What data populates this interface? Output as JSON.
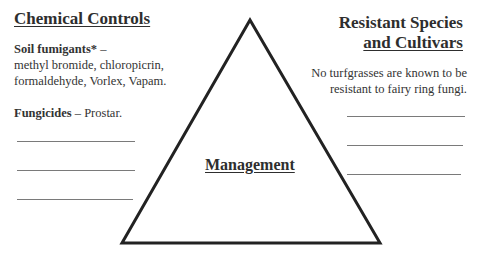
{
  "diagram": {
    "center_label": "Management",
    "left": {
      "title": "Chemical Controls",
      "items": [
        {
          "label": "Soil fumigants*",
          "separator": " –",
          "text": "methyl bromide, chloropicrin, formaldehyde, Vorlex, Vapam."
        },
        {
          "label": "Fungicides",
          "separator": " – ",
          "text": "Prostar."
        }
      ],
      "blank_lines": 3
    },
    "right": {
      "title_line1": "Resistant Species",
      "title_line2": "and Cultivars",
      "text": "No turfgrasses are known to be resistant to fairy ring fungi.",
      "blank_lines": 3
    },
    "triangle": {
      "stroke": "#222222",
      "apex": [
        250,
        20
      ],
      "base_left": [
        122,
        244
      ],
      "base_right": [
        380,
        244
      ]
    }
  }
}
